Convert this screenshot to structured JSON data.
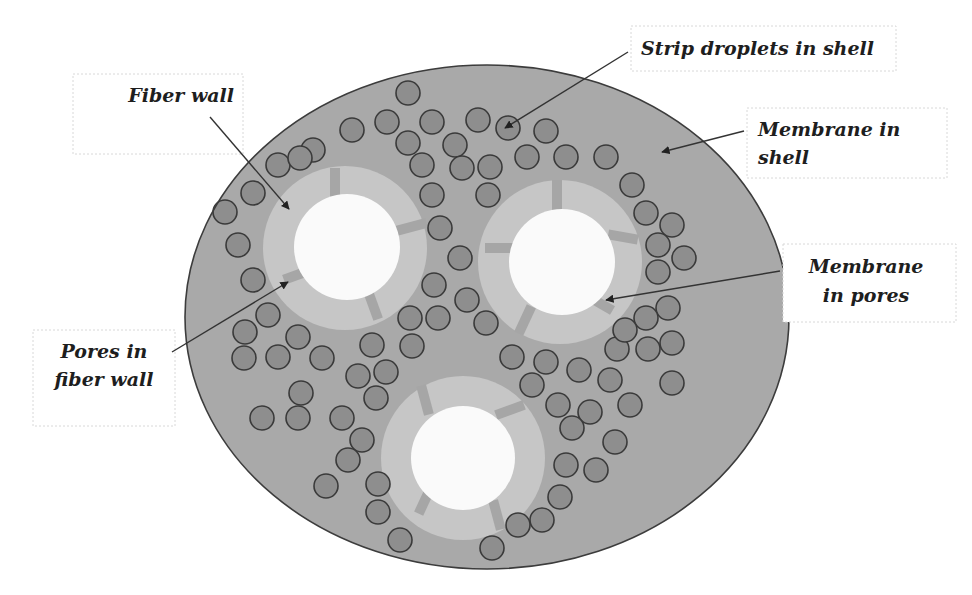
{
  "figure": {
    "colors": {
      "shell": "#a9a9a9",
      "shell_outline": "#3c3c3c",
      "fiber_wall": "#c6c6c6",
      "fiber_lumen": "#fafafa",
      "pore": "#a6a6a6",
      "droplet_fill": "#8e8e8e",
      "droplet_outline": "#3a3a3a"
    },
    "fiber_count": 3,
    "labels": {
      "fiber_wall": {
        "lines": [
          "Fiber wall"
        ]
      },
      "strip_droplets": {
        "lines": [
          "Strip droplets in shell"
        ]
      },
      "membrane_shell": {
        "lines": [
          "Membrane in",
          "shell"
        ]
      },
      "membrane_pores": {
        "lines": [
          "Membrane",
          "in pores"
        ]
      },
      "pores_wall": {
        "lines": [
          "Pores in",
          "fiber wall"
        ]
      }
    }
  }
}
